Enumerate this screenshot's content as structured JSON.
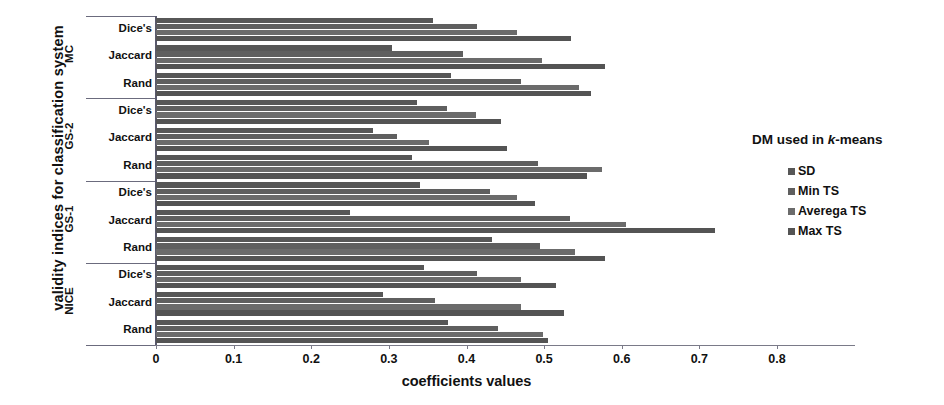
{
  "axis": {
    "y_title": "validity indices for classification system",
    "x_title": "coefficients values",
    "x_ticks": [
      "0",
      "0.1",
      "0.2",
      "0.3",
      "0.4",
      "0.5",
      "0.6",
      "0.7",
      "0.8"
    ]
  },
  "legend": {
    "title_pre": "DM used  in ",
    "title_ital": "k",
    "title_post": "-means",
    "items": [
      {
        "label": "SD",
        "color": "#575757"
      },
      {
        "label": "Min TS",
        "color": "#5f5f5f"
      },
      {
        "label": "Averega TS",
        "color": "#6b6b6b"
      },
      {
        "label": "Max TS",
        "color": "#545454"
      }
    ]
  },
  "chart_data": {
    "type": "bar",
    "orientation": "horizontal",
    "title": "",
    "xlabel": "coefficients values",
    "ylabel": "validity indices for classification system",
    "xlim": [
      0,
      0.8
    ],
    "grid": false,
    "legend_position": "right",
    "legend_title": "DM used in k-means",
    "series": [
      "SD",
      "Min TS",
      "Averega TS",
      "Max TS"
    ],
    "groups": [
      {
        "name": "MC",
        "categories": [
          {
            "name": "Dice's",
            "values": [
              0.357,
              0.414,
              0.465,
              0.535
            ]
          },
          {
            "name": "Jaccard",
            "values": [
              0.304,
              0.396,
              0.497,
              0.578
            ]
          },
          {
            "name": "Rand",
            "values": [
              0.38,
              0.47,
              0.545,
              0.56
            ]
          }
        ]
      },
      {
        "name": "GS-2",
        "categories": [
          {
            "name": "Dice's",
            "values": [
              0.336,
              0.375,
              0.412,
              0.445
            ]
          },
          {
            "name": "Jaccard",
            "values": [
              0.279,
              0.31,
              0.352,
              0.452
            ]
          },
          {
            "name": "Rand",
            "values": [
              0.33,
              0.492,
              0.575,
              0.555
            ]
          }
        ]
      },
      {
        "name": "GS-1",
        "categories": [
          {
            "name": "Dice's",
            "values": [
              0.34,
              0.43,
              0.465,
              0.488
            ]
          },
          {
            "name": "Jaccard",
            "values": [
              0.25,
              0.533,
              0.605,
              0.72
            ]
          },
          {
            "name": "Rand",
            "values": [
              0.433,
              0.495,
              0.54,
              0.578
            ]
          }
        ]
      },
      {
        "name": "NICE",
        "categories": [
          {
            "name": "Dice's",
            "values": [
              0.345,
              0.413,
              0.47,
              0.515
            ]
          },
          {
            "name": "Jaccard",
            "values": [
              0.293,
              0.36,
              0.47,
              0.525
            ]
          },
          {
            "name": "Rand",
            "values": [
              0.376,
              0.44,
              0.498,
              0.505
            ]
          }
        ]
      }
    ]
  }
}
